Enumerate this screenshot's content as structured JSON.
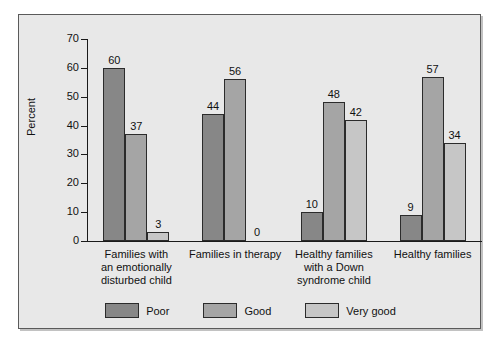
{
  "chart_data": {
    "type": "bar",
    "title": "",
    "xlabel": "",
    "ylabel": "Percent",
    "ylim": [
      0,
      70
    ],
    "yticks": [
      0,
      10,
      20,
      30,
      40,
      50,
      60,
      70
    ],
    "grid": false,
    "legend_position": "bottom",
    "categories": [
      "Families with an emotionally disturbed child",
      "Families in therapy",
      "Healthy families with a Down syndrome child",
      "Healthy families"
    ],
    "category_lines": [
      [
        "Families with",
        "an emotionally",
        "disturbed child"
      ],
      [
        "Families in therapy"
      ],
      [
        "Healthy families",
        "with a Down",
        "syndrome child"
      ],
      [
        "Healthy families"
      ]
    ],
    "series": [
      {
        "name": "Poor",
        "color": "#878787",
        "values": [
          60,
          44,
          10,
          9
        ]
      },
      {
        "name": "Good",
        "color": "#a5a5a5",
        "values": [
          37,
          56,
          48,
          57
        ]
      },
      {
        "name": "Very good",
        "color": "#c6c6c6",
        "values": [
          3,
          0,
          42,
          34
        ]
      }
    ]
  },
  "legend": [
    {
      "label": "Poor",
      "color": "#878787"
    },
    {
      "label": "Good",
      "color": "#a5a5a5"
    },
    {
      "label": "Very good",
      "color": "#c6c6c6"
    }
  ]
}
